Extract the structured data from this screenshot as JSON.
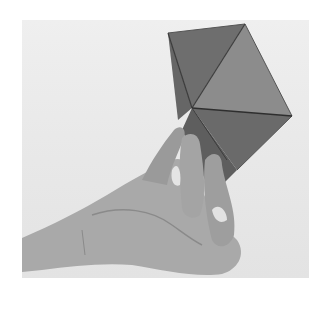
{
  "photo": {
    "alt": "Grayscale photograph of a hand holding a folded paper polyhedron (triangular faces) against a light background",
    "colors": {
      "background": "#e9e9e9",
      "face_light": "#8a8a8a",
      "face_mid": "#727272",
      "face_dark": "#5c5c5c",
      "skin": "#a8a8a8",
      "skin_shadow": "#8c8c8c",
      "edge": "#3a3a3a"
    }
  }
}
